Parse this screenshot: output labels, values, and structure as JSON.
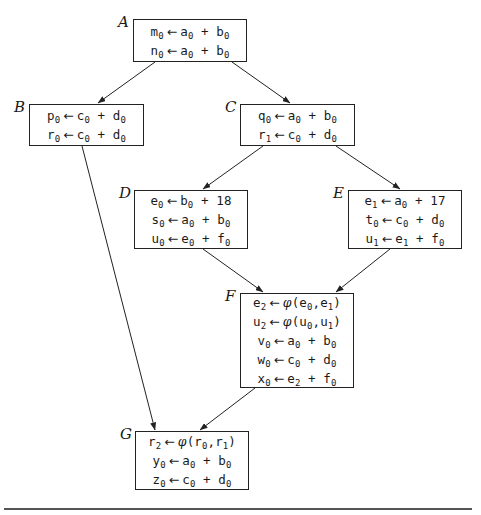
{
  "diagram": {
    "type": "control-flow-graph-ssa",
    "blocks": [
      {
        "id": "A",
        "label": "A",
        "box": [
          133,
          19,
          114,
          43
        ],
        "statements": [
          {
            "lhs": [
              "m",
              "0"
            ],
            "rhs": [
              [
                "a",
                "0"
              ],
              "+",
              [
                "b",
                "0"
              ]
            ]
          },
          {
            "lhs": [
              "n",
              "0"
            ],
            "rhs": [
              [
                "a",
                "0"
              ],
              "+",
              [
                "b",
                "0"
              ]
            ]
          }
        ]
      },
      {
        "id": "B",
        "label": "B",
        "box": [
          29,
          104,
          115,
          42
        ],
        "statements": [
          {
            "lhs": [
              "p",
              "0"
            ],
            "rhs": [
              [
                "c",
                "0"
              ],
              "+",
              [
                "d",
                "0"
              ]
            ]
          },
          {
            "lhs": [
              "r",
              "0"
            ],
            "rhs": [
              [
                "c",
                "0"
              ],
              "+",
              [
                "d",
                "0"
              ]
            ]
          }
        ]
      },
      {
        "id": "C",
        "label": "C",
        "box": [
          240,
          104,
          115,
          42
        ],
        "statements": [
          {
            "lhs": [
              "q",
              "0"
            ],
            "rhs": [
              [
                "a",
                "0"
              ],
              "+",
              [
                "b",
                "0"
              ]
            ]
          },
          {
            "lhs": [
              "r",
              "1"
            ],
            "rhs": [
              [
                "c",
                "0"
              ],
              "+",
              [
                "d",
                "0"
              ]
            ]
          }
        ]
      },
      {
        "id": "D",
        "label": "D",
        "box": [
          134,
          190,
          114,
          59
        ],
        "statements": [
          {
            "lhs": [
              "e",
              "0"
            ],
            "rhs": [
              [
                "b",
                "0"
              ],
              "+",
              "18"
            ]
          },
          {
            "lhs": [
              "s",
              "0"
            ],
            "rhs": [
              [
                "a",
                "0"
              ],
              "+",
              [
                "b",
                "0"
              ]
            ]
          },
          {
            "lhs": [
              "u",
              "0"
            ],
            "rhs": [
              [
                "e",
                "0"
              ],
              "+",
              [
                "f",
                "0"
              ]
            ]
          }
        ]
      },
      {
        "id": "E",
        "label": "E",
        "box": [
          348,
          190,
          114,
          59
        ],
        "statements": [
          {
            "lhs": [
              "e",
              "1"
            ],
            "rhs": [
              [
                "a",
                "0"
              ],
              "+",
              "17"
            ]
          },
          {
            "lhs": [
              "t",
              "0"
            ],
            "rhs": [
              [
                "c",
                "0"
              ],
              "+",
              [
                "d",
                "0"
              ]
            ]
          },
          {
            "lhs": [
              "u",
              "1"
            ],
            "rhs": [
              [
                "e",
                "1"
              ],
              "+",
              [
                "f",
                "0"
              ]
            ]
          }
        ]
      },
      {
        "id": "F",
        "label": "F",
        "box": [
          240,
          293,
          114,
          95
        ],
        "statements": [
          {
            "lhs": [
              "e",
              "2"
            ],
            "phi": [
              [
                "e",
                "0"
              ],
              [
                "e",
                "1"
              ]
            ]
          },
          {
            "lhs": [
              "u",
              "2"
            ],
            "phi": [
              [
                "u",
                "0"
              ],
              [
                "u",
                "1"
              ]
            ]
          },
          {
            "lhs": [
              "v",
              "0"
            ],
            "rhs": [
              [
                "a",
                "0"
              ],
              "+",
              [
                "b",
                "0"
              ]
            ]
          },
          {
            "lhs": [
              "w",
              "0"
            ],
            "rhs": [
              [
                "c",
                "0"
              ],
              "+",
              [
                "d",
                "0"
              ]
            ]
          },
          {
            "lhs": [
              "x",
              "0"
            ],
            "rhs": [
              [
                "e",
                "2"
              ],
              "+",
              [
                "f",
                "0"
              ]
            ]
          }
        ]
      },
      {
        "id": "G",
        "label": "G",
        "box": [
          135,
          431,
          114,
          59
        ],
        "statements": [
          {
            "lhs": [
              "r",
              "2"
            ],
            "phi": [
              [
                "r",
                "0"
              ],
              [
                "r",
                "1"
              ]
            ]
          },
          {
            "lhs": [
              "y",
              "0"
            ],
            "rhs": [
              [
                "a",
                "0"
              ],
              "+",
              [
                "b",
                "0"
              ]
            ]
          },
          {
            "lhs": [
              "z",
              "0"
            ],
            "rhs": [
              [
                "c",
                "0"
              ],
              "+",
              [
                "d",
                "0"
              ]
            ]
          }
        ]
      }
    ],
    "edges": [
      {
        "from": "A",
        "to": "B",
        "path": [
          155,
          62,
          98,
          103
        ]
      },
      {
        "from": "A",
        "to": "C",
        "path": [
          232,
          62,
          290,
          103
        ]
      },
      {
        "from": "B",
        "to": "G",
        "path": [
          82,
          146,
          155,
          430
        ]
      },
      {
        "from": "C",
        "to": "D",
        "path": [
          263,
          146,
          203,
          189
        ]
      },
      {
        "from": "C",
        "to": "E",
        "path": [
          336,
          146,
          400,
          189
        ]
      },
      {
        "from": "D",
        "to": "F",
        "path": [
          203,
          249,
          263,
          292
        ]
      },
      {
        "from": "E",
        "to": "F",
        "path": [
          390,
          249,
          336,
          292
        ]
      },
      {
        "from": "F",
        "to": "G",
        "path": [
          255,
          388,
          200,
          430
        ]
      }
    ],
    "symbols": {
      "assign": "←",
      "phi": "φ",
      "plus": "+"
    },
    "colors": {
      "stroke": "#222222",
      "text": "#1a1a1a",
      "background": "#ffffff",
      "rule": "#555555"
    }
  }
}
